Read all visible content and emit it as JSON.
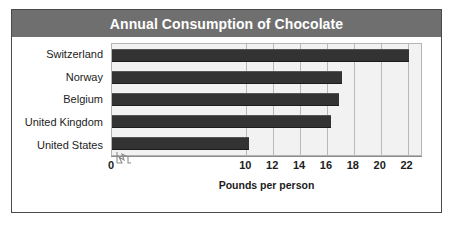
{
  "title": "Annual Consumption of Chocolate",
  "axis_title": "Pounds per person",
  "colors": {
    "title_bar": "#6f6f6f",
    "title_text": "#ffffff",
    "bar": "#333333",
    "plot_background": "#f2f2f2",
    "gridline": "#b9b9b9",
    "frame_border": "#4a4a4a"
  },
  "chart_data": {
    "type": "bar",
    "orientation": "horizontal",
    "title": "Annual Consumption of Chocolate",
    "xlabel": "Pounds per person",
    "ylabel": "",
    "categories": [
      "Switzerland",
      "Norway",
      "Belgium",
      "United Kingdom",
      "United States"
    ],
    "values": [
      22.1,
      17.1,
      16.9,
      16.3,
      10.2
    ],
    "tick_labels": [
      "0",
      "10",
      "12",
      "14",
      "16",
      "18",
      "20",
      "22"
    ],
    "tick_values": [
      0,
      10,
      12,
      14,
      16,
      18,
      20,
      22
    ],
    "axis_break": true,
    "axis_break_between": [
      0,
      10
    ],
    "xlim": [
      0,
      23
    ],
    "grid": true,
    "legend": null
  }
}
